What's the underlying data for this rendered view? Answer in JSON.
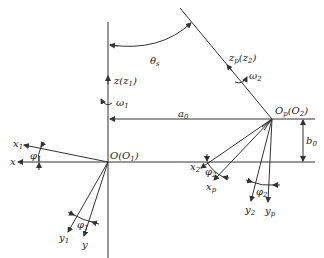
{
  "diagram": {
    "title": "",
    "labels": {
      "z1": "z(z",
      "z1_sub": "1",
      "z1_close": ")",
      "omega1": "ω",
      "omega1_sub": "1",
      "theta": "θ",
      "theta_sub": "s",
      "zp": "z",
      "zp_sub": "p",
      "zp_paren": "(z",
      "zp_paren_sub": "2",
      "zp_close": ")",
      "omega2": "ω",
      "omega2_sub": "2",
      "a0": "a",
      "a0_sub": "0",
      "Op": "O",
      "Op_sub": "p",
      "Op_paren": "(O",
      "Op_paren_sub": "2",
      "Op_close": ")",
      "b0": "b",
      "b0_sub": "0",
      "O": "O(O",
      "O_sub": "1",
      "O_close": ")",
      "x1": "x",
      "x1_sub": "1",
      "x": "x",
      "phi1_a": "φ",
      "phi1_a_sub": "1",
      "phi1_b": "φ",
      "phi1_b_sub": "1",
      "y1": "y",
      "y1_sub": "1",
      "y": "y",
      "x2": "x",
      "x2_sub": "2",
      "phi2_a": "φ",
      "phi2_a_sub": "2",
      "xp": "x",
      "xp_sub": "p",
      "phi2_b": "φ",
      "phi2_b_sub": "2",
      "y2": "y",
      "y2_sub": "2",
      "yp": "y",
      "yp_sub": "p"
    },
    "colors": {
      "stroke": "#333333",
      "text": "#222222",
      "background": "#ffffff"
    }
  }
}
